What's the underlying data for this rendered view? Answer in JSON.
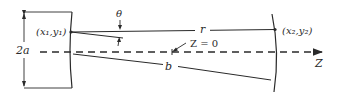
{
  "diagram": {
    "type": "resonator-geometry",
    "labels": {
      "point1": "(x₁,y₁)",
      "point2": "(x₂,y₂)",
      "aperture": "2a",
      "angle": "θ",
      "distance_r": "r",
      "distance_b": "b",
      "origin": "Z = 0",
      "axis": "Z"
    },
    "colors": {
      "stroke": "#2a2a2a",
      "background": "#ffffff"
    }
  }
}
